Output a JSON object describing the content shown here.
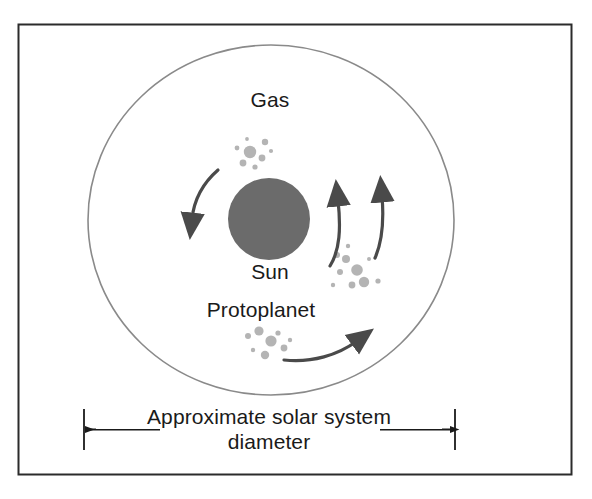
{
  "figure": {
    "background_color": "#ffffff",
    "border_color": "#2b2b2b",
    "line_color": "#4a4a4a",
    "sun_color": "#6b6b6b",
    "particle_color": "#b4b4b4",
    "text_color": "#1a1a1a"
  },
  "labels": {
    "gas": "Gas",
    "sun": "Sun",
    "protoplanet": "Protoplanet"
  },
  "caption": {
    "line1": "Approximate solar system",
    "line2": "diameter"
  },
  "diagram_data": {
    "type": "diagram",
    "frame": {
      "x": 18,
      "y": 24,
      "width": 554,
      "height": 451
    },
    "nebula_ellipse": {
      "cx": 271,
      "cy": 220,
      "rx": 183,
      "ry": 175
    },
    "sun_circle": {
      "cx": 269,
      "cy": 219,
      "r": 41
    },
    "particle_clusters": [
      {
        "name": "gas-cluster-top",
        "cx": 250,
        "cy": 152
      },
      {
        "name": "gas-cluster-right",
        "cx": 357,
        "cy": 268
      },
      {
        "name": "gas-cluster-bottom",
        "cx": 275,
        "cy": 345
      }
    ],
    "arrows": [
      {
        "name": "arrow-left-down",
        "direction": "counterclockwise-down-left"
      },
      {
        "name": "arrow-inner-up",
        "direction": "up"
      },
      {
        "name": "arrow-outer-up",
        "direction": "up"
      },
      {
        "name": "arrow-bottom-right",
        "direction": "right"
      }
    ],
    "dimension_line": {
      "left_tick_x": 84,
      "right_tick_x": 455,
      "y": 429,
      "tick_top": 409,
      "tick_bottom": 450
    }
  }
}
